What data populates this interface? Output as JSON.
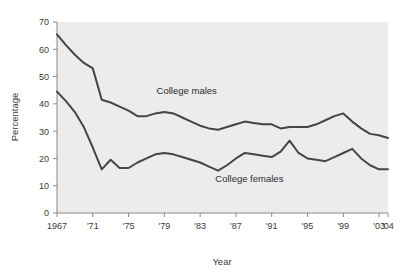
{
  "chart_data": {
    "type": "line",
    "title": "",
    "xlabel": "Year",
    "ylabel": "Percentage",
    "xlim": [
      1967,
      2004
    ],
    "ylim": [
      0,
      70
    ],
    "ytick_values": [
      0,
      10,
      20,
      30,
      40,
      50,
      60,
      70
    ],
    "ytick_labels": [
      "0",
      "10",
      "20",
      "30",
      "40",
      "50",
      "60",
      "70"
    ],
    "xtick_values": [
      1967,
      1971,
      1975,
      1979,
      1983,
      1987,
      1991,
      1995,
      1999,
      2003,
      2004
    ],
    "xtick_labels": [
      "1967",
      "'71",
      "'75",
      "'79",
      "'83",
      "'87",
      "'91",
      "'95",
      "'99",
      "'03",
      "'04"
    ],
    "grid": false,
    "legend_position": "inline-annotation",
    "x": [
      1967,
      1968,
      1969,
      1970,
      1971,
      1972,
      1973,
      1974,
      1975,
      1976,
      1977,
      1978,
      1979,
      1980,
      1981,
      1982,
      1983,
      1984,
      1985,
      1986,
      1987,
      1988,
      1989,
      1990,
      1991,
      1992,
      1993,
      1994,
      1995,
      1996,
      1997,
      1998,
      1999,
      2000,
      2001,
      2002,
      2003,
      2004
    ],
    "series": [
      {
        "name": "College males",
        "color": "#454545",
        "values": [
          65.5,
          61.5,
          58.0,
          55.0,
          53.0,
          41.5,
          40.5,
          39.0,
          37.5,
          35.5,
          35.5,
          36.5,
          37.0,
          36.5,
          35.0,
          33.5,
          32.0,
          31.0,
          30.5,
          31.5,
          32.5,
          33.5,
          33.0,
          32.5,
          32.5,
          31.0,
          31.5,
          31.5,
          31.5,
          32.5,
          34.0,
          35.5,
          36.5,
          33.5,
          31.0,
          29.0,
          28.5,
          27.5
        ]
      },
      {
        "name": "College females",
        "color": "#454545",
        "values": [
          44.5,
          41.0,
          37.0,
          31.5,
          24.0,
          16.0,
          19.5,
          16.5,
          16.5,
          18.5,
          20.0,
          21.5,
          22.0,
          21.5,
          20.5,
          19.5,
          18.5,
          17.0,
          15.5,
          17.5,
          20.0,
          22.0,
          21.5,
          21.0,
          20.5,
          22.5,
          26.5,
          22.0,
          20.0,
          19.5,
          19.0,
          20.5,
          22.0,
          23.5,
          20.0,
          17.5,
          16.0,
          16.0
        ]
      }
    ],
    "annotations": [
      {
        "text": "College males",
        "x": 1981.5,
        "y": 43.5
      },
      {
        "text": "College females",
        "x": 1988.5,
        "y": 11.5
      }
    ],
    "plot_background_color": "#ececec",
    "line_color": "#454545",
    "axis_color": "#8a8a8a",
    "text_color": "#3a3a3a"
  }
}
